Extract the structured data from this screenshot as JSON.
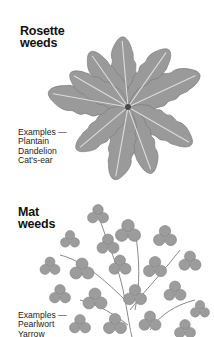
{
  "sections": [
    {
      "title_line1": "Rosette",
      "title_line2": "weeds",
      "examples_label": "Examples —",
      "examples": [
        "Plantain",
        "Dandelion",
        "Cat's-ear"
      ],
      "illustration": "rosette-weed-illustration"
    },
    {
      "title_line1": "Mat",
      "title_line2": "weeds",
      "examples_label": "Examples —",
      "examples": [
        "Pearlwort",
        "Yarrow"
      ],
      "illustration": "mat-weed-illustration"
    }
  ],
  "colors": {
    "leaf_fill": "#8f8f8f",
    "leaf_light": "#a9a9a9",
    "vein": "#d9d9d9",
    "text": "#111111",
    "background": "#ffffff"
  }
}
